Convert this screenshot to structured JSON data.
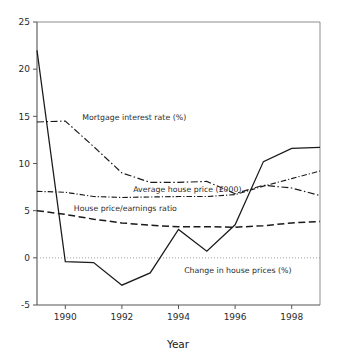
{
  "chart_data": {
    "type": "line",
    "title": "",
    "xlabel": "Year",
    "ylabel": "",
    "xlim": [
      1989,
      1999
    ],
    "ylim": [
      -5,
      25
    ],
    "grid": false,
    "legend_position": "inline-annotations",
    "x": [
      1989,
      1990,
      1991,
      1992,
      1993,
      1994,
      1995,
      1996,
      1997,
      1998,
      1999
    ],
    "xticks": [
      "1990",
      "1992",
      "1994",
      "1996",
      "1998"
    ],
    "xtick_values": [
      1990,
      1992,
      1994,
      1996,
      1998
    ],
    "yticks": [
      "25",
      "20",
      "15",
      "10",
      "5",
      "0",
      "-5"
    ],
    "ytick_values": [
      25,
      20,
      15,
      10,
      5,
      0,
      -5
    ],
    "zero_reference_line": 0,
    "series": [
      {
        "name": "Change in house prices (%)",
        "style": "solid",
        "label_x": 1994.2,
        "label_y": -1.6,
        "values": [
          22.0,
          -0.4,
          -0.5,
          -2.9,
          -1.6,
          3.0,
          0.7,
          3.5,
          10.2,
          11.6,
          11.7
        ]
      },
      {
        "name": "Mortgage interest rate (%)",
        "style": "dash-dot",
        "label_x": 1990.6,
        "label_y": 14.6,
        "values": [
          14.4,
          14.5,
          11.8,
          9.0,
          8.0,
          8.0,
          8.1,
          6.8,
          7.7,
          7.4,
          6.6
        ]
      },
      {
        "name": "Average house price (£000)",
        "style": "dash-dot-dense",
        "label_x": 1992.4,
        "label_y": 7.0,
        "values": [
          7.05,
          6.95,
          6.5,
          6.4,
          6.45,
          6.5,
          6.5,
          6.7,
          7.6,
          8.4,
          9.2
        ]
      },
      {
        "name": "House price/earnings ratio",
        "style": "dashed",
        "label_x": 1990.3,
        "label_y": 5.0,
        "values": [
          5.0,
          4.6,
          4.1,
          3.7,
          3.45,
          3.3,
          3.3,
          3.25,
          3.4,
          3.7,
          3.85
        ]
      }
    ]
  },
  "axes": {
    "x_axis_title": "Year",
    "y_tick_labels": [
      "25",
      "20",
      "15",
      "10",
      "5",
      "0",
      "-5"
    ],
    "x_tick_labels": [
      "1990",
      "1992",
      "1994",
      "1996",
      "1998"
    ]
  },
  "annotations": {
    "mortgage_interest_rate": "Mortgage interest rate (%)",
    "average_house_price": "Average house price (£000)",
    "house_price_earnings_ratio": "House price/earnings ratio",
    "change_in_house_prices": "Change in house prices (%)"
  },
  "colors": {
    "background": "#ffffff",
    "line": "#1a1a1a",
    "axis": "#555555",
    "frame": "#8d8d8d",
    "zero_line": "#9a9a9a",
    "text": "#2b2b2b"
  }
}
